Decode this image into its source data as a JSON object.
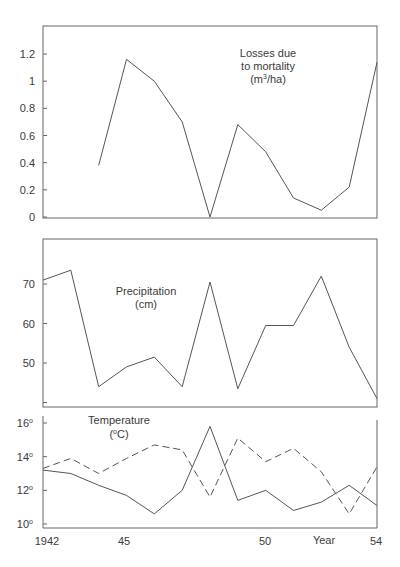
{
  "chart_data": [
    {
      "type": "line",
      "title": "Losses due to mortality (m³/ha)",
      "title_lines": [
        "Losses due",
        "to mortality",
        "(m³/ha)"
      ],
      "xlabel": "",
      "ylabel": "",
      "x": [
        1944,
        1945,
        1946,
        1947,
        1948,
        1949,
        1950,
        1951,
        1952,
        1953,
        1954
      ],
      "series": [
        {
          "name": "Losses due to mortality",
          "style": "solid",
          "values": [
            0.38,
            1.16,
            1.0,
            0.7,
            0.0,
            0.68,
            0.48,
            0.14,
            0.05,
            0.22,
            1.14
          ]
        }
      ],
      "yticks": [
        "0",
        "0.2",
        "0.4",
        "0.6",
        "0.8",
        "1",
        "1.2"
      ],
      "ylim": [
        0,
        1.35
      ],
      "grid": false
    },
    {
      "type": "line",
      "title": "Precipitation (cm)",
      "title_lines": [
        "Precipitation",
        "(cm)"
      ],
      "x": [
        1942,
        1943,
        1944,
        1945,
        1946,
        1947,
        1948,
        1949,
        1950,
        1951,
        1952,
        1953,
        1954
      ],
      "series": [
        {
          "name": "Precipitation",
          "style": "solid",
          "values": [
            71,
            73.5,
            44,
            49,
            51.5,
            44,
            70.5,
            43.5,
            59.5,
            59.5,
            72,
            54,
            41
          ]
        }
      ],
      "yticks": [
        "50",
        "60",
        "70"
      ],
      "ylim": [
        40,
        78
      ],
      "grid": false
    },
    {
      "type": "line",
      "title": "Temperature (°C)",
      "title_lines": [
        "Temperature",
        "(°C)"
      ],
      "xlabel": "Year",
      "x": [
        1942,
        1943,
        1944,
        1945,
        1946,
        1947,
        1948,
        1949,
        1950,
        1951,
        1952,
        1953,
        1954
      ],
      "series": [
        {
          "name": "Temperature (solid)",
          "style": "solid",
          "values": [
            13.2,
            13.0,
            12.3,
            11.7,
            10.6,
            12.0,
            15.8,
            11.4,
            12.0,
            10.8,
            11.3,
            12.3,
            11.1
          ]
        },
        {
          "name": "Temperature (dashed)",
          "style": "dashed",
          "values": [
            13.3,
            13.9,
            13.0,
            13.9,
            14.7,
            14.4,
            11.6,
            15.1,
            13.7,
            14.5,
            13.1,
            10.6,
            13.4
          ]
        }
      ],
      "yticks": [
        "10°",
        "12°",
        "14°",
        "16°"
      ],
      "ylim": [
        10,
        16
      ],
      "xticks": [
        "1942",
        "45",
        "50",
        "54"
      ],
      "grid": false
    }
  ],
  "labels": {
    "losses_title": [
      "Losses due",
      "to mortality",
      "(m",
      "3",
      "/ha)"
    ],
    "precip_title": [
      "Precipitation",
      "(cm)"
    ],
    "temp_title": [
      "Temperature",
      "(",
      "o",
      "C)"
    ],
    "x_axis_title": "Year",
    "x_ticks": [
      "1942",
      "45",
      "50",
      "54"
    ],
    "losses_yticks": [
      "1.2",
      "1",
      "0.8",
      "0.6",
      "0.4",
      "0.2",
      "0"
    ],
    "precip_yticks": [
      "70",
      "60",
      "50"
    ],
    "temp_yticks": [
      "16",
      "14",
      "12",
      "10"
    ],
    "degree": "o"
  }
}
